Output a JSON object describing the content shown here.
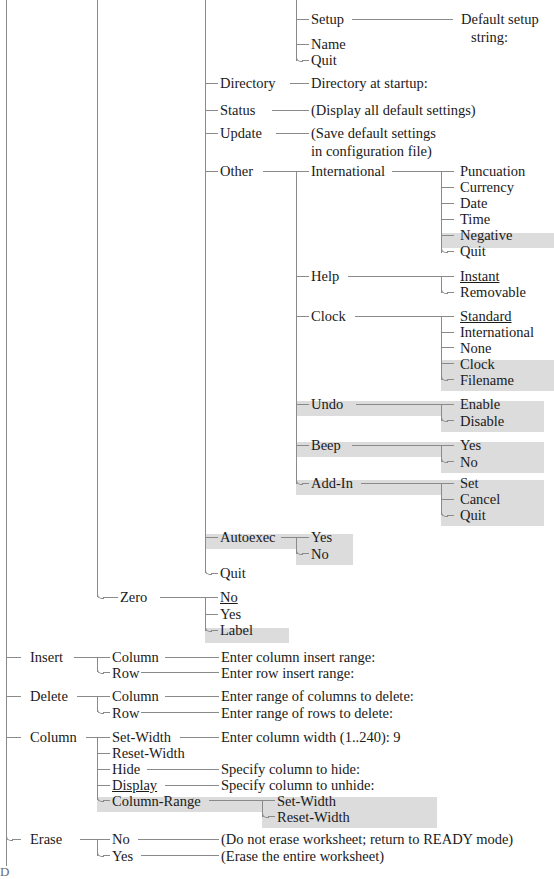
{
  "diagram": {
    "type": "menu-tree",
    "legend": {
      "highlight_color": "#dcdcdc",
      "line_color": "#8a8a8a",
      "text_color": "#1a1a1a",
      "underline_means": "default selection",
      "highlight_means": "new or changed command"
    },
    "stray_mark": "D"
  },
  "nodes": {
    "setup": "Setup",
    "default_setup_string_l1": "Default setup",
    "default_setup_string_l2": "string:",
    "name": "Name",
    "quit_1": "Quit",
    "directory": "Directory",
    "directory_at_startup": "Directory at startup:",
    "status": "Status",
    "status_desc": "(Display all default settings)",
    "update": "Update",
    "update_desc_l1": "(Save default settings",
    "update_desc_l2": "in configuration file)",
    "other": "Other",
    "international": "International",
    "puncuation": "Puncuation",
    "currency": "Currency",
    "date": "Date",
    "time": "Time",
    "negative": "Negative",
    "quit_intl": "Quit",
    "help": "Help",
    "instant": "Instant",
    "removable": "Removable",
    "clock": "Clock",
    "clock_standard": "Standard",
    "clock_international": "International",
    "clock_none": "None",
    "clock_clock": "Clock",
    "clock_filename": "Filename",
    "undo": "Undo",
    "undo_enable": "Enable",
    "undo_disable": "Disable",
    "beep": "Beep",
    "beep_yes": "Yes",
    "beep_no": "No",
    "addin": "Add-In",
    "addin_set": "Set",
    "addin_cancel": "Cancel",
    "addin_quit": "Quit",
    "autoexec": "Autoexec",
    "autoexec_yes": "Yes",
    "autoexec_no": "No",
    "quit_other": "Quit",
    "zero": "Zero",
    "zero_no": "No",
    "zero_yes": "Yes",
    "zero_label": "Label",
    "insert": "Insert",
    "insert_column": "Column",
    "insert_column_prompt": "Enter column insert range:",
    "insert_row": "Row",
    "insert_row_prompt": "Enter row insert range:",
    "delete": "Delete",
    "delete_column": "Column",
    "delete_column_prompt": "Enter range of columns to delete:",
    "delete_row": "Row",
    "delete_row_prompt": "Enter range of rows to delete:",
    "column": "Column",
    "column_set_width": "Set-Width",
    "column_set_width_prompt": "Enter column width (1..240): 9",
    "column_reset_width": "Reset-Width",
    "column_hide": "Hide",
    "column_hide_prompt": "Specify column to hide:",
    "column_display": "Display",
    "column_display_prompt": "Specify column to unhide:",
    "column_range": "Column-Range",
    "column_range_set_width": "Set-Width",
    "column_range_reset_width": "Reset-Width",
    "erase": "Erase",
    "erase_no": "No",
    "erase_no_desc": "(Do not erase worksheet; return to READY mode)",
    "erase_yes": "Yes",
    "erase_yes_desc": "(Erase the entire worksheet)"
  }
}
